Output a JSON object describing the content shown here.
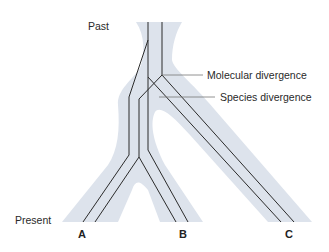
{
  "diagram": {
    "type": "gene-tree-within-species-tree",
    "time_axis": {
      "top_label": "Past",
      "bottom_label": "Present"
    },
    "annotations": {
      "molecular": "Molecular divergence",
      "species": "Species divergence"
    },
    "taxa": [
      "A",
      "B",
      "C"
    ],
    "colors": {
      "species_band": "#dde3ec",
      "gene_lineage": "#2b2b2b",
      "leader_line": "#777777",
      "text": "#2a2a2a"
    }
  }
}
